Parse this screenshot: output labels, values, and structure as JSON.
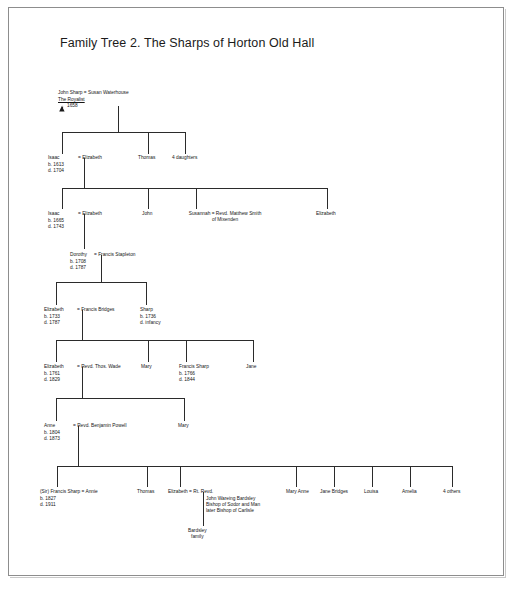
{
  "document": {
    "title": "Family Tree 2. The Sharps of Horton Old Hall"
  },
  "symbols": {
    "death_marker": "died-symbol-icon"
  },
  "generations": [
    {
      "id": "gen1",
      "nodes": [
        {
          "id": "john-sharp",
          "name": "John Sharp = Susan Waterhouse",
          "epithet": "The Royalist",
          "death_year": "1658"
        }
      ]
    },
    {
      "id": "gen2",
      "nodes": [
        {
          "id": "isaac-1613",
          "name": "Isaac",
          "spouse": "= Elizabeth",
          "birth": "b. 1613",
          "death": "d. 1704"
        },
        {
          "id": "thomas-gen2",
          "name": "Thomas"
        },
        {
          "id": "four-daughters-gen2",
          "name": "4 daughters"
        }
      ]
    },
    {
      "id": "gen3",
      "nodes": [
        {
          "id": "isaac-1665",
          "name": "Isaac",
          "spouse": "= Elizabeth",
          "birth": "b. 1665",
          "death": "d. 1743"
        },
        {
          "id": "john-gen3",
          "name": "John"
        },
        {
          "id": "susannah",
          "name": "Susannah = Revd. Matthew Smith",
          "line2": "of Mixenden"
        },
        {
          "id": "elizabeth-gen3",
          "name": "Elizabeth"
        }
      ]
    },
    {
      "id": "gen4",
      "nodes": [
        {
          "id": "dorothy",
          "name": "Dorothy",
          "spouse": "= Francis Stapleton",
          "birth": "b. 1708",
          "death": "d. 1787"
        }
      ]
    },
    {
      "id": "gen5",
      "nodes": [
        {
          "id": "elizabeth-1733",
          "name": "Elizabeth",
          "spouse": "= Francis Bridges",
          "birth": "b. 1733",
          "death": "d. 1787"
        },
        {
          "id": "sharp-1736",
          "name": "Sharp",
          "birth": "b. 1736",
          "death": "d. infancy"
        }
      ]
    },
    {
      "id": "gen6",
      "nodes": [
        {
          "id": "elizabeth-1761",
          "name": "Elizabeth",
          "spouse": "= Revd. Thos. Wade",
          "birth": "b. 1761",
          "death": "d. 1829"
        },
        {
          "id": "mary-gen6",
          "name": "Mary"
        },
        {
          "id": "francis-sharp-1766",
          "name": "Francis Sharp",
          "birth": "b. 1766",
          "death": "d. 1844"
        },
        {
          "id": "jane-gen6",
          "name": "Jane"
        }
      ]
    },
    {
      "id": "gen7",
      "nodes": [
        {
          "id": "anne-1804",
          "name": "Anne",
          "spouse": "= Revd. Benjamin Powell",
          "birth": "b. 1804",
          "death": "d. 1873"
        },
        {
          "id": "mary-gen7",
          "name": "Mary"
        }
      ]
    },
    {
      "id": "gen8",
      "nodes": [
        {
          "id": "sir-francis-sharp",
          "name": "(Sir) Francis Sharp = Annie",
          "birth": "b. 1827",
          "death": "d. 1911"
        },
        {
          "id": "thomas-gen8",
          "name": "Thomas"
        },
        {
          "id": "elizabeth-bardsley",
          "name": "Elizabeth = Rt. Revd.",
          "spouse_lines": [
            "John Wareing Bardsley",
            "Bishop of Sodor and Man",
            "later Bishop of Carlisle"
          ]
        },
        {
          "id": "mary-anne-gen8",
          "name": "Mary Anne"
        },
        {
          "id": "jane-bridges-gen8",
          "name": "Jane Bridges"
        },
        {
          "id": "louisa-gen8",
          "name": "Louisa"
        },
        {
          "id": "amelia-gen8",
          "name": "Amelia"
        },
        {
          "id": "four-others-gen8",
          "name": "4 others"
        }
      ]
    },
    {
      "id": "gen9",
      "nodes": [
        {
          "id": "bardsley-family",
          "name": "Bardsley",
          "line2": "family"
        }
      ]
    }
  ]
}
